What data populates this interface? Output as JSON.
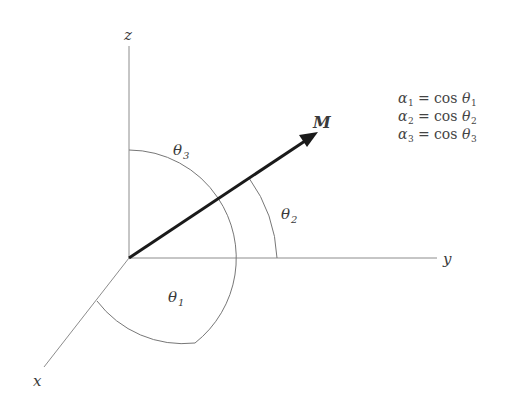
{
  "diagram": {
    "axes": {
      "x": {
        "label": "x"
      },
      "y": {
        "label": "y"
      },
      "z": {
        "label": "z"
      }
    },
    "vector": {
      "label": "M"
    },
    "angles": [
      {
        "label": "θ",
        "sub": "1",
        "between": "M and x"
      },
      {
        "label": "θ",
        "sub": "2",
        "between": "M and y"
      },
      {
        "label": "θ",
        "sub": "3",
        "between": "M and z"
      }
    ],
    "equations": [
      {
        "lhs": "α",
        "lhs_sub": "1",
        "op": "=",
        "fn": "cos",
        "var": "θ",
        "var_sub": "1"
      },
      {
        "lhs": "α",
        "lhs_sub": "2",
        "op": "=",
        "fn": "cos",
        "var": "θ",
        "var_sub": "2"
      },
      {
        "lhs": "α",
        "lhs_sub": "3",
        "op": "=",
        "fn": "cos",
        "var": "θ",
        "var_sub": "3"
      }
    ],
    "colors": {
      "axis": "#8c8c8c",
      "arc": "#777777",
      "vector": "#1a1a1a",
      "text": "#3a3a3a"
    }
  }
}
